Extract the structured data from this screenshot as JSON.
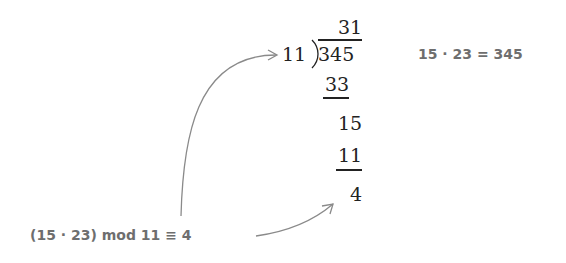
{
  "division": {
    "quotient": "31",
    "divisor": "11",
    "dividend": "345",
    "steps": [
      "33",
      "15",
      "11",
      "4"
    ]
  },
  "annotations": {
    "product": "15 · 23 = 345",
    "modulo": "(15 · 23) mod 11 ≡ 4"
  },
  "colors": {
    "text": "#222222",
    "annotation": "#6e6e6e",
    "arrow": "#8a8a8a"
  }
}
